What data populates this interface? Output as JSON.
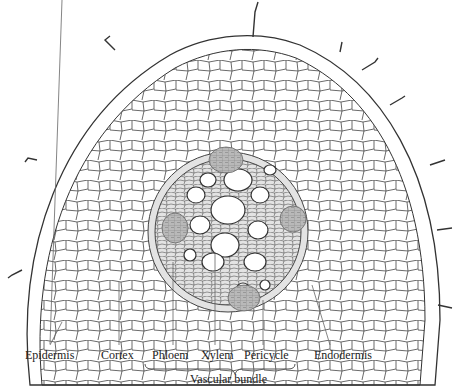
{
  "diagram": {
    "colors": {
      "line": "#333333",
      "tissue_fill": "#ffffff",
      "phloem_fill": "#b8b8b8",
      "pericycle_band": "#d9d9d9"
    },
    "labels": {
      "epidermis": "Epidermis",
      "cortex": "Cortex",
      "phloem": "Phloem",
      "xylem": "Xylem",
      "pericycle": "Pericycle",
      "endodermis": "Endodermis",
      "vascular_bundle": "Vascular bundle"
    }
  }
}
